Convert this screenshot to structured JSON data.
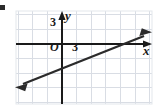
{
  "figure": {
    "type": "coordinate-plane-line-graph",
    "width": 158,
    "height": 111,
    "background_color": "#ffffff",
    "grid": {
      "visible": true,
      "color": "#d7dce3",
      "spacing_px": 14.6,
      "left": 16,
      "right": 152,
      "top": 11,
      "bottom": 104
    },
    "axes": {
      "color": "#1a1a1a",
      "x_axis": {
        "y_px": 44,
        "x_start": 16,
        "x_end": 152,
        "arrow": "right"
      },
      "y_axis": {
        "x_px": 62,
        "y_start": 11,
        "y_end": 104,
        "arrow": "up"
      }
    },
    "labels": {
      "y_axis_label": "y",
      "x_axis_label": "x",
      "origin_label": "O",
      "y_tick_label": "3",
      "x_tick_label": "3"
    },
    "line": {
      "color": "#2b2b2b",
      "stroke_width": 2.4,
      "arrows": "both",
      "start_px": [
        18,
        86
      ],
      "end_px": [
        149,
        34
      ],
      "slope": 0.4,
      "y_intercept": 1,
      "x_intercept": -2.5,
      "equation": "y = 0.4x + 1"
    },
    "corner_mark": {
      "visible": true,
      "color": "#2b2b2b"
    }
  }
}
